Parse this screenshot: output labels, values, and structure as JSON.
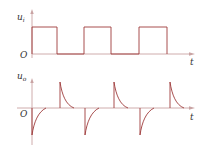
{
  "diagram": {
    "colors": {
      "axis": "#c9a3a3",
      "wave": "#9e3b3b",
      "label": "#333333"
    },
    "top_panel": {
      "y_label": "u",
      "y_label_sub": "i",
      "origin_label": "O",
      "x_label": "t",
      "waveform": "square pulse train",
      "pulses": 3
    },
    "bottom_panel": {
      "y_label": "u",
      "y_label_sub": "o",
      "origin_label": "O",
      "x_label": "t",
      "waveform": "differentiated spikes (exponential decay)",
      "positive_spikes": 3,
      "negative_spikes": 3
    }
  }
}
